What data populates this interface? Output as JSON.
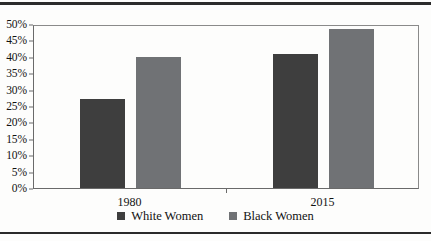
{
  "chart_data": {
    "type": "bar",
    "title": "",
    "subtitle": "",
    "xlabel": "",
    "ylabel": "",
    "categories": [
      "1980",
      "2015"
    ],
    "series": [
      {
        "name": "White Women",
        "color": "#3e3e3e",
        "values": [
          27,
          41
        ]
      },
      {
        "name": "Black Women",
        "color": "#707275",
        "values": [
          40,
          48.5
        ]
      }
    ],
    "ylim": [
      0,
      50
    ],
    "ytick_step": 5,
    "ytick_labels": [
      "50%",
      "45%",
      "40%",
      "35%",
      "30%",
      "25%",
      "20%",
      "15%",
      "10%",
      "5%",
      "0%"
    ],
    "ytick_values": [
      50,
      45,
      40,
      35,
      30,
      25,
      20,
      15,
      10,
      5,
      0
    ],
    "grid": false,
    "legend_position": "bottom",
    "value_suffix": "%"
  },
  "legend": {
    "items": [
      {
        "label": "White Women",
        "color": "#3e3e3e"
      },
      {
        "label": "Black Women",
        "color": "#707275"
      }
    ]
  },
  "colors": {
    "series_dark": "#3e3e3e",
    "series_light": "#707275",
    "axis": "#6a6a6a",
    "rule": "#2b2b2b",
    "background": "#fdfdfc"
  }
}
